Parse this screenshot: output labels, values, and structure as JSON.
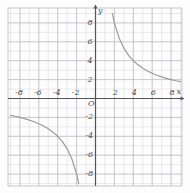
{
  "figure": {
    "kind": "coordinate-grid-plot",
    "width": 190,
    "height": 193,
    "background": "#fdfdfd",
    "grid_color": "#b9b9bf",
    "grid_minor_color": "#dcdce0",
    "axis_color": "#55555c",
    "curve_color": "#9a9aa0",
    "label_color": "#4a4a4a"
  },
  "axis_labels": {
    "origin": "O",
    "x_axis_name": "x",
    "y_axis_name": "y",
    "x_negative": [
      "-8",
      "-6",
      "-4",
      "-2"
    ],
    "x_positive": [
      "2",
      "4",
      "6",
      "8"
    ],
    "y_positive": [
      "2",
      "4",
      "6",
      "8"
    ],
    "y_negative": [
      "-2",
      "-4",
      "-6",
      "-8"
    ]
  },
  "chart_data": {
    "type": "line",
    "title": "",
    "xlabel": "x",
    "ylabel": "y",
    "xlim": [
      -9,
      9
    ],
    "ylim": [
      -9,
      9
    ],
    "xticks": [
      -8,
      -6,
      -4,
      -2,
      2,
      4,
      6,
      8
    ],
    "yticks": [
      -8,
      -6,
      -4,
      -2,
      2,
      4,
      6,
      8
    ],
    "grid": true,
    "grid_step": 1,
    "major_grid_step": 2,
    "legend": "none",
    "series": [
      {
        "name": "branch-quadrant-I",
        "equation": "y = 16/x",
        "k": 16,
        "x": [
          1.78,
          2,
          2.5,
          3,
          3.5,
          4,
          4.5,
          5,
          5.5,
          6,
          6.5,
          7,
          7.5,
          8,
          8.5,
          9
        ],
        "values": [
          9,
          8,
          6.4,
          5.33,
          4.57,
          4,
          3.56,
          3.2,
          2.91,
          2.67,
          2.46,
          2.29,
          2.13,
          2,
          1.88,
          1.78
        ]
      },
      {
        "name": "branch-quadrant-III",
        "equation": "y = 16/x",
        "k": 16,
        "x": [
          -9,
          -8.5,
          -8,
          -7.5,
          -7,
          -6.5,
          -6,
          -5.5,
          -5,
          -4.5,
          -4,
          -3.5,
          -3,
          -2.5,
          -2,
          -1.78
        ],
        "values": [
          -1.78,
          -1.88,
          -2,
          -2.13,
          -2.29,
          -2.46,
          -2.67,
          -2.91,
          -3.2,
          -3.56,
          -4,
          -4.57,
          -5.33,
          -6.4,
          -8,
          -9
        ]
      }
    ]
  }
}
